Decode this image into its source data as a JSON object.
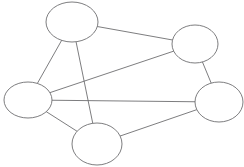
{
  "figure": {
    "kind": "node-link-diagram",
    "title": "",
    "background_color": "#ffffff",
    "width": 244,
    "height": 167
  },
  "style": {
    "node_fill": "#ffffff",
    "node_stroke": "#6e6e70",
    "node_stroke_width": 0.9,
    "edge_stroke": "#6e6e70",
    "edge_stroke_width": 0.9
  },
  "graph": {
    "node_count": 5,
    "edge_count": 8,
    "directed": false,
    "nodes": [
      {
        "id": "top",
        "label": "",
        "cx": 72,
        "cy": 22,
        "rx": 26,
        "ry": 20
      },
      {
        "id": "upper-right",
        "label": "",
        "cx": 195,
        "cy": 44,
        "rx": 23,
        "ry": 19
      },
      {
        "id": "left",
        "label": "",
        "cx": 28,
        "cy": 100,
        "rx": 24,
        "ry": 18
      },
      {
        "id": "right",
        "label": "",
        "cx": 219,
        "cy": 102,
        "rx": 24,
        "ry": 20
      },
      {
        "id": "bottom",
        "label": "",
        "cx": 97,
        "cy": 144,
        "rx": 25,
        "ry": 21
      }
    ],
    "edges": [
      {
        "source": "top",
        "target": "upper-right"
      },
      {
        "source": "top",
        "target": "left"
      },
      {
        "source": "top",
        "target": "bottom"
      },
      {
        "source": "left",
        "target": "upper-right"
      },
      {
        "source": "left",
        "target": "right"
      },
      {
        "source": "left",
        "target": "bottom"
      },
      {
        "source": "bottom",
        "target": "right"
      },
      {
        "source": "upper-right",
        "target": "right"
      }
    ]
  }
}
